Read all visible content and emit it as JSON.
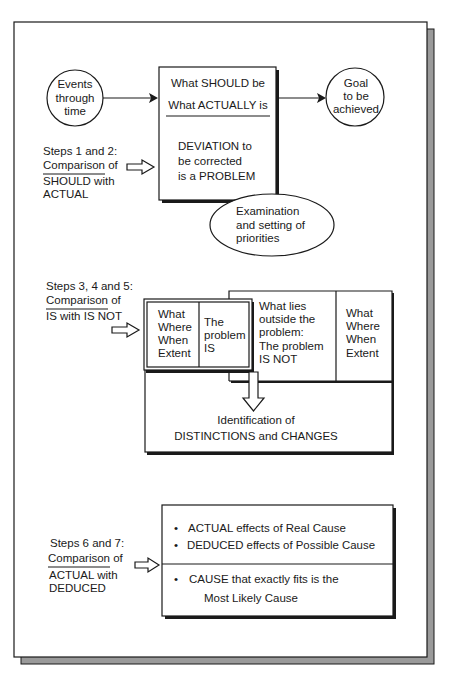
{
  "figure": {
    "colors": {
      "ink": "#1a1a1a",
      "paper": "#ffffff",
      "shadow": "#9a9a9a"
    },
    "section1": {
      "events_circle": [
        "Events",
        "through",
        "time"
      ],
      "goal_circle": [
        "Goal",
        "to be",
        "achieved"
      ],
      "main_box": {
        "top_lines": [
          "What SHOULD be",
          "What ACTUALLY is"
        ],
        "bottom_lines": [
          "DEVIATION  to",
          "be corrected",
          "is a PROBLEM"
        ]
      },
      "ellipse": [
        "Examination",
        "and setting of",
        "priorities"
      ],
      "step_label": {
        "title": "Steps 1 and 2:",
        "numerator": "Comparison of",
        "denominator_lines": [
          "SHOULD with",
          "ACTUAL"
        ]
      }
    },
    "section2": {
      "step_label": {
        "title": "Steps 3, 4 and 5:",
        "numerator": "Comparison of",
        "denominator_lines": [
          "IS with IS NOT"
        ]
      },
      "is_box": {
        "dimensions": [
          "What",
          "Where",
          "When",
          "Extent"
        ],
        "label": [
          "The",
          "problem",
          "IS"
        ]
      },
      "is_not_box": {
        "label": [
          "What lies",
          "outside the",
          "problem:",
          "The problem",
          "IS NOT"
        ],
        "dimensions": [
          "What",
          "Where",
          "When",
          "Extent"
        ]
      },
      "result": [
        "Identification  of",
        "DISTINCTIONS  and  CHANGES"
      ]
    },
    "section3": {
      "step_label": {
        "title": "Steps 6 and 7:",
        "numerator": "Comparison of",
        "denominator_lines": [
          "ACTUAL with",
          "DEDUCED"
        ]
      },
      "effects": [
        "ACTUAL effects of Real Cause",
        "DEDUCED effects of Possible Cause"
      ],
      "conclusion": [
        "CAUSE  that exactly fits is the",
        "Most Likely  Cause"
      ],
      "bullet": "•"
    }
  }
}
